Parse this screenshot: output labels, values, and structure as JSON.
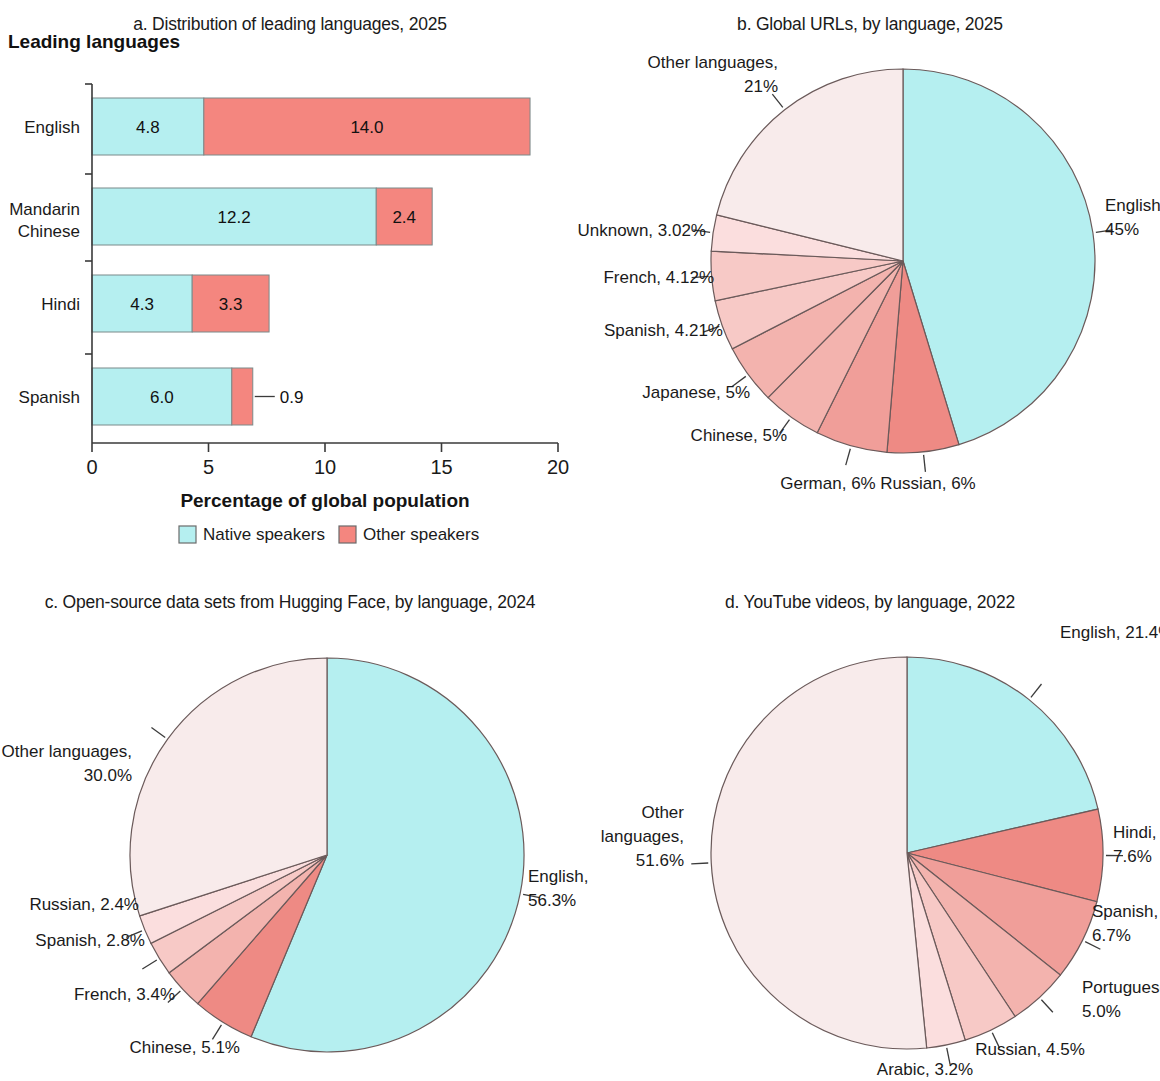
{
  "colors": {
    "native_cyan": "#b5eff0",
    "other_red": "#f4867f",
    "pie_other_pale": "#f8ebeb",
    "pie_mid_1": "#fbdede",
    "pie_mid_2": "#f7c9c6",
    "pie_mid_3": "#f3b3ae",
    "pie_mid_4": "#f09e99",
    "pie_strong": "#ee8a84",
    "outline": "#6b5a5a",
    "axis": "#3a3a3a"
  },
  "panel_a": {
    "title": "a. Distribution of leading languages, 2025",
    "section_heading": "Leading languages",
    "xlabel": "Percentage of global population",
    "legend": [
      {
        "label": "Native speakers",
        "color": "#b5eff0"
      },
      {
        "label": "Other speakers",
        "color": "#f4867f"
      }
    ]
  },
  "panel_b": {
    "title": "b. Global URLs, by language, 2025"
  },
  "panel_c": {
    "title": "c. Open-source data sets from Hugging Face, by language, 2024"
  },
  "panel_d": {
    "title": "d. YouTube videos, by language, 2022"
  },
  "chart_data": [
    {
      "id": "a",
      "type": "bar",
      "orientation": "horizontal",
      "stacked": true,
      "title": "a. Distribution of leading languages, 2025",
      "xlabel": "Percentage of global population",
      "ylabel": "Leading languages",
      "xlim": [
        0,
        20
      ],
      "xticks": [
        0,
        5,
        10,
        15,
        20
      ],
      "xtick_labels": [
        "0",
        "5",
        "10",
        "15",
        "20"
      ],
      "grid": false,
      "legend_position": "bottom",
      "categories": [
        "English",
        "Mandarin Chinese",
        "Hindi",
        "Spanish"
      ],
      "series": [
        {
          "name": "Native speakers",
          "color": "#b5eff0",
          "values": [
            4.8,
            12.2,
            4.3,
            6.0
          ],
          "labels": [
            "4.8",
            "12.2",
            "4.3",
            "6.0"
          ]
        },
        {
          "name": "Other speakers",
          "color": "#f4867f",
          "values": [
            14.0,
            2.4,
            3.3,
            0.9
          ],
          "labels": [
            "14.0",
            "2.4",
            "3.3",
            "0.9"
          ]
        }
      ]
    },
    {
      "id": "b",
      "type": "pie",
      "title": "b. Global URLs, by language, 2025",
      "start_angle_deg": 0,
      "direction": "clockwise",
      "slices": [
        {
          "label": "English, 45%",
          "name": "English",
          "value": 45,
          "color": "#b5eff0",
          "side": "right",
          "lx": 1105,
          "ly": 211,
          "l2": "45%"
        },
        {
          "label": "Russian, 6%",
          "name": "Russian",
          "value": 6,
          "color": "#ee8a84",
          "side": "bottom",
          "lx": 928,
          "ly": 489
        },
        {
          "label": "German, 6%",
          "name": "German",
          "value": 6,
          "color": "#f09e99",
          "side": "bottom",
          "lx": 828,
          "ly": 489
        },
        {
          "label": "Chinese, 5%",
          "name": "Chinese",
          "value": 5,
          "color": "#f3b3ae",
          "side": "left",
          "lx": 787,
          "ly": 441
        },
        {
          "label": "Japanese, 5%",
          "name": "Japanese",
          "value": 5,
          "color": "#f3b3ae",
          "side": "left",
          "lx": 750,
          "ly": 398
        },
        {
          "label": "Spanish, 4.21%",
          "name": "Spanish",
          "value": 4.21,
          "color": "#f7c9c6",
          "side": "left",
          "lx": 723,
          "ly": 336
        },
        {
          "label": "French, 4.12%",
          "name": "French",
          "value": 4.12,
          "color": "#f7c9c6",
          "side": "left",
          "lx": 714,
          "ly": 283
        },
        {
          "label": "Unknown, 3.02%",
          "name": "Unknown",
          "value": 3.02,
          "color": "#fbdede",
          "side": "left",
          "lx": 706,
          "ly": 236
        },
        {
          "label": "Other languages,",
          "name": "Other languages",
          "value": 21,
          "color": "#f8ebeb",
          "side": "topleft",
          "lx": 778,
          "ly": 68,
          "l2": "21%"
        }
      ]
    },
    {
      "id": "c",
      "type": "pie",
      "title": "c. Open-source data sets from Hugging Face, by language, 2024",
      "start_angle_deg": 0,
      "direction": "clockwise",
      "slices": [
        {
          "label": "English,",
          "name": "English",
          "value": 56.3,
          "color": "#b5eff0",
          "side": "right",
          "lx": 528,
          "ly": 882,
          "l2": "56.3%"
        },
        {
          "label": "Chinese, 5.1%",
          "name": "Chinese",
          "value": 5.1,
          "color": "#ee8a84",
          "side": "bottomleft",
          "lx": 240,
          "ly": 1053
        },
        {
          "label": "French, 3.4%",
          "name": "French",
          "value": 3.4,
          "color": "#f3b3ae",
          "side": "left",
          "lx": 175,
          "ly": 1000
        },
        {
          "label": "Spanish, 2.8%",
          "name": "Spanish",
          "value": 2.8,
          "color": "#f7c9c6",
          "side": "left",
          "lx": 145,
          "ly": 946
        },
        {
          "label": "Russian, 2.4%",
          "name": "Russian",
          "value": 2.4,
          "color": "#fbdede",
          "side": "left",
          "lx": 139,
          "ly": 910
        },
        {
          "label": "Other languages,",
          "name": "Other languages",
          "value": 30.0,
          "color": "#f8ebeb",
          "side": "left",
          "lx": 132,
          "ly": 757,
          "l2": "30.0%"
        }
      ]
    },
    {
      "id": "d",
      "type": "pie",
      "title": "d. YouTube videos, by language, 2022",
      "start_angle_deg": 0,
      "direction": "clockwise",
      "slices": [
        {
          "label": "English, 21.4%",
          "name": "English",
          "value": 21.4,
          "color": "#b5eff0",
          "side": "topright",
          "lx": 1060,
          "ly": 638
        },
        {
          "label": "Hindi,",
          "name": "Hindi",
          "value": 7.6,
          "color": "#ee8a84",
          "side": "right",
          "lx": 1113,
          "ly": 838,
          "l2": "7.6%"
        },
        {
          "label": "Spanish,",
          "name": "Spanish",
          "value": 6.7,
          "color": "#f09e99",
          "side": "right",
          "lx": 1092,
          "ly": 917,
          "l2": "6.7%"
        },
        {
          "label": "Portuguese,",
          "name": "Portuguese",
          "value": 5.0,
          "color": "#f3b3ae",
          "side": "right",
          "lx": 1082,
          "ly": 993,
          "l2": "5.0%"
        },
        {
          "label": "Russian, 4.5%",
          "name": "Russian",
          "value": 4.5,
          "color": "#f7c9c6",
          "side": "bottom",
          "lx": 1030,
          "ly": 1055
        },
        {
          "label": "Arabic, 3.2%",
          "name": "Arabic",
          "value": 3.2,
          "color": "#fbdede",
          "side": "bottom",
          "lx": 925,
          "ly": 1075
        },
        {
          "label": "Other",
          "name": "Other languages",
          "value": 51.6,
          "color": "#f8ebeb",
          "side": "left",
          "lx": 684,
          "ly": 818,
          "l2": "languages,",
          "l3": "51.6%"
        }
      ]
    }
  ]
}
